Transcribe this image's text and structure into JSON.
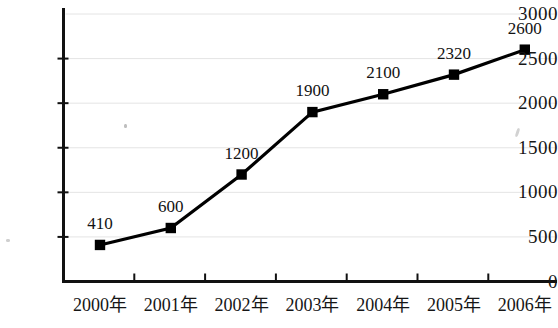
{
  "chart_data": {
    "type": "line",
    "title": "",
    "subtitle": "",
    "xlabel": "",
    "ylabel": "",
    "categories": [
      "2000年",
      "2001年",
      "2002年",
      "2003年",
      "2004年",
      "2005年",
      "2006年"
    ],
    "values": [
      410,
      600,
      1200,
      1900,
      2100,
      2320,
      2600
    ],
    "point_labels": [
      "410",
      "600",
      "1200",
      "1900",
      "2100",
      "2320",
      "2600"
    ],
    "series": [
      {
        "name": "",
        "values": [
          410,
          600,
          1200,
          1900,
          2100,
          2320,
          2600
        ]
      }
    ],
    "ylim": [
      0,
      3000
    ],
    "ytick_values": [
      0,
      500,
      1000,
      1500,
      2000,
      2500,
      3000
    ],
    "ytick_labels": [
      "0",
      "500",
      "1000",
      "1500",
      "2000",
      "2500",
      "3000"
    ],
    "grid": true,
    "grid_axis": "y",
    "legend": false,
    "legend_position": "none",
    "marker": "square",
    "line_color": "#000000",
    "marker_color": "#000000",
    "grid_color": "#e4e4e4",
    "axis_color": "#111111",
    "background_color": "#ffffff"
  },
  "axes": {
    "y_axis_name": "value-axis",
    "x_axis_name": "year-axis"
  }
}
